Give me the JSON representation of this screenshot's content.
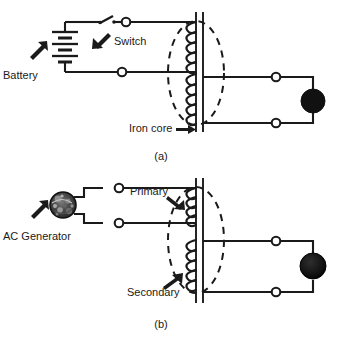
{
  "figure": {
    "panels": [
      {
        "id": "a",
        "caption": "(a)",
        "labels": {
          "battery": "Battery",
          "switch": "Switch",
          "iron_core": "Iron core"
        },
        "components": [
          {
            "name": "battery",
            "type": "dc-source"
          },
          {
            "name": "switch",
            "type": "knife-switch",
            "state": "open"
          },
          {
            "name": "primary-coil",
            "type": "coil",
            "turns": 9
          },
          {
            "name": "secondary-coil",
            "type": "coil",
            "turns": 7
          },
          {
            "name": "iron-core",
            "type": "core"
          },
          {
            "name": "load",
            "type": "lamp"
          },
          {
            "name": "flux-ellipse",
            "type": "dashed-ellipse"
          }
        ],
        "terminal_count": 6
      },
      {
        "id": "b",
        "caption": "(b)",
        "labels": {
          "ac_generator": "AC Generator",
          "primary": "Primary",
          "secondary": "Secondary"
        },
        "components": [
          {
            "name": "ac-generator",
            "type": "ac-source"
          },
          {
            "name": "primary-coil",
            "type": "coil",
            "turns": 8
          },
          {
            "name": "secondary-coil",
            "type": "coil",
            "turns": 8
          },
          {
            "name": "iron-core",
            "type": "core"
          },
          {
            "name": "load",
            "type": "lamp"
          },
          {
            "name": "flux-ellipse",
            "type": "dashed-ellipse"
          }
        ],
        "terminal_count": 6
      }
    ],
    "colors": {
      "ink": "#1a1a1a",
      "background": "#ffffff",
      "load_fill": "#111111"
    }
  }
}
